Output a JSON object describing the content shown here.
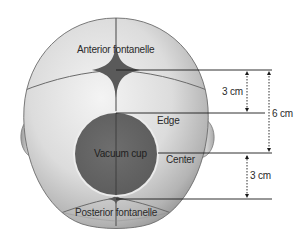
{
  "diagram": {
    "labels": {
      "anterior_fontanelle": "Anterior fontanelle",
      "posterior_fontanelle": "Posterior fontanelle",
      "vacuum_cup": "Vacuum cup",
      "edge": "Edge",
      "center": "Center"
    },
    "measurements": {
      "upper_segment": "3 cm",
      "total_span": "6 cm",
      "lower_segment": "3 cm"
    },
    "colors": {
      "skull_light": "#e6e6e6",
      "skull_shadow": "#9a9a9a",
      "fontanelle": "#5a5a5a",
      "vacuum_cup": "#666666",
      "lines": "#1a1a1a"
    }
  }
}
